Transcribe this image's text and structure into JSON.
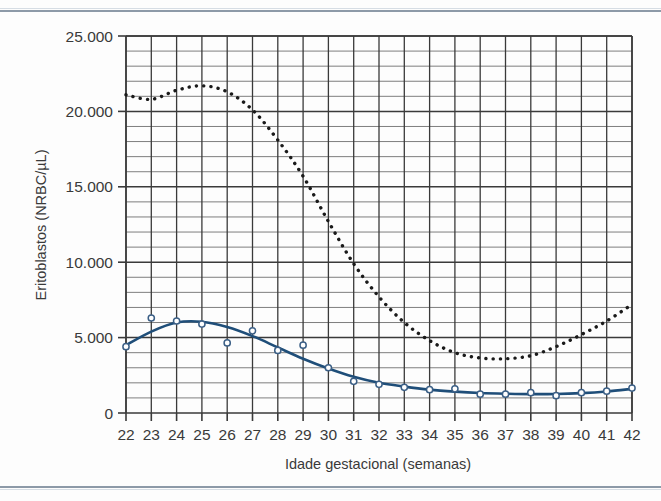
{
  "figure": {
    "background_color": "#fdfdfd",
    "rule_color": "#8d9aa8"
  },
  "chart_data": {
    "type": "line",
    "title": "",
    "subtitle": "",
    "xlabel": "Idade gestacional (semanas)",
    "ylabel": "Eritoblastos (NRBC/µL)",
    "xlim": [
      22,
      42
    ],
    "ylim": [
      0,
      25000
    ],
    "grid": "major and minor horizontal gridlines (every 5.000 major, 1.000 minor); vertical gridline at every week",
    "legend": "none",
    "y_tick_labels": [
      "0",
      "5.000",
      "10.000",
      "15.000",
      "20.000",
      "25.000"
    ],
    "y_tick_values": [
      0,
      5000,
      10000,
      15000,
      20000,
      25000
    ],
    "x_tick_labels": [
      "22",
      "23",
      "24",
      "25",
      "26",
      "27",
      "28",
      "29",
      "30",
      "31",
      "32",
      "33",
      "34",
      "35",
      "36",
      "37",
      "38",
      "39",
      "40",
      "41",
      "42"
    ],
    "x": [
      22,
      23,
      24,
      25,
      26,
      27,
      28,
      29,
      30,
      31,
      32,
      33,
      34,
      35,
      36,
      37,
      38,
      39,
      40,
      41,
      42
    ],
    "series": [
      {
        "name": "upper dotted curve",
        "style": "dotted",
        "color": "#1a1a1a",
        "values": [
          21100,
          20800,
          21400,
          21700,
          21300,
          20100,
          18100,
          15700,
          12700,
          9900,
          7700,
          6000,
          4800,
          4000,
          3650,
          3600,
          3800,
          4400,
          5200,
          6100,
          7200
        ]
      },
      {
        "name": "lower fitted curve",
        "style": "solid",
        "color": "#1f4e79",
        "values": [
          4500,
          5400,
          6000,
          6050,
          5700,
          5100,
          4350,
          3600,
          2950,
          2400,
          2000,
          1750,
          1550,
          1420,
          1330,
          1280,
          1250,
          1260,
          1320,
          1430,
          1600
        ]
      }
    ],
    "scatter": {
      "name": "observed means",
      "marker": "open-circle",
      "color": "#3b5f86",
      "points": [
        {
          "x": 22,
          "y": 4400
        },
        {
          "x": 23,
          "y": 6300
        },
        {
          "x": 24,
          "y": 6100
        },
        {
          "x": 25,
          "y": 5900
        },
        {
          "x": 26,
          "y": 4650
        },
        {
          "x": 27,
          "y": 5450
        },
        {
          "x": 28,
          "y": 4150
        },
        {
          "x": 29,
          "y": 4500
        },
        {
          "x": 30,
          "y": 3000
        },
        {
          "x": 31,
          "y": 2100
        },
        {
          "x": 32,
          "y": 1900
        },
        {
          "x": 33,
          "y": 1700
        },
        {
          "x": 34,
          "y": 1550
        },
        {
          "x": 35,
          "y": 1600
        },
        {
          "x": 36,
          "y": 1250
        },
        {
          "x": 37,
          "y": 1250
        },
        {
          "x": 38,
          "y": 1350
        },
        {
          "x": 39,
          "y": 1150
        },
        {
          "x": 40,
          "y": 1350
        },
        {
          "x": 41,
          "y": 1450
        },
        {
          "x": 42,
          "y": 1650
        }
      ]
    }
  }
}
